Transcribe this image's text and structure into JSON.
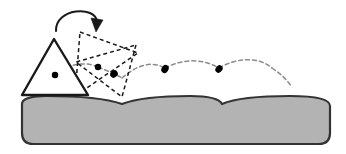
{
  "figure": {
    "canvas": {
      "width": 346,
      "height": 154,
      "background": "#ffffff"
    },
    "colors": {
      "ink": "#1a1a1a",
      "ground_fill": "#b3b3b3",
      "ground_stroke": "#333333",
      "trajectory": "#8c8c8c",
      "dot": "#000000",
      "dashed_body": "#1a1a1a"
    },
    "ground": {
      "label": "scalloped ground block",
      "left": 22,
      "right": 330,
      "bottom": 144,
      "corner_radius": 11,
      "crest_top_y": 96,
      "cusp_bottom_y": 104,
      "arc_cusp_x": [
        122,
        222
      ],
      "fill": "#b3b3b3",
      "stroke": "#333333",
      "stroke_width": 2.2
    },
    "solid_body": {
      "label": "triangle initial pose",
      "kind": "triangle",
      "vertices": [
        [
          54,
          39
        ],
        [
          22,
          95
        ],
        [
          88,
          95
        ]
      ],
      "stroke": "#1a1a1a",
      "stroke_width": 2.4,
      "fill": "#ffffff",
      "center_of_mass": [
        55,
        75
      ]
    },
    "dashed_bodies": [
      {
        "label": "triangle pose 2 (rotated)",
        "kind": "triangle",
        "vertices": [
          [
            80,
            32
          ],
          [
            138,
            53
          ],
          [
            75,
            96
          ]
        ],
        "center_of_mass": [
          98,
          67
        ],
        "dash": "4 3",
        "stroke_width": 1.5
      },
      {
        "label": "triangle pose 3 (rotated further)",
        "kind": "triangle",
        "vertices": [
          [
            136,
            45
          ],
          [
            122,
            97
          ],
          [
            76,
            62
          ]
        ],
        "center_of_mass": [
          114,
          74
        ],
        "dash": "4 3",
        "stroke_width": 1.5
      }
    ],
    "rotation_arrow": {
      "label": "rotation direction arrow",
      "path": "M 56,31 C 56,9 95,6 97,24",
      "arrow_tip": [
        96,
        30
      ],
      "stroke": "#1a1a1a",
      "stroke_width": 2.0
    },
    "trajectory": {
      "label": "bouncing center-of-mass path",
      "stroke": "#8c8c8c",
      "stroke_width": 1.5,
      "dash": "4 3",
      "segments": [
        "M 55,75 C 66,64 86,61 98,67",
        "M 98,67 C 110,72 114,73 122,78",
        "M 122,78 C 136,66 150,60 165,68",
        "M 165,68 C 180,60 200,57 219,68",
        "M 219,68 C 236,58 258,56 272,68",
        "M 272,68 C 281,74 287,79 290,84"
      ],
      "bounce_dots": [
        [
          122,
          78
        ],
        [
          165,
          68
        ],
        [
          219,
          68
        ]
      ]
    },
    "dots": {
      "label": "center of mass markers",
      "radius": 3.2,
      "color": "#000000"
    }
  }
}
